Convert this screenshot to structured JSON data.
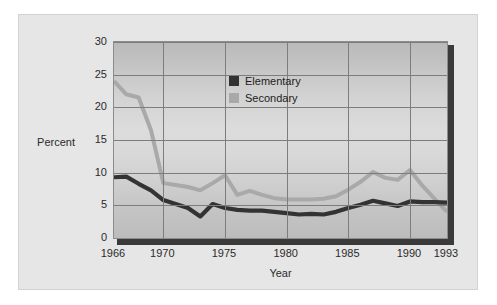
{
  "chart_data": {
    "type": "line",
    "title": "",
    "xlabel": "Year",
    "ylabel": "Percent",
    "xlim": [
      1966,
      1993
    ],
    "ylim": [
      0,
      30
    ],
    "ytick_labels": [
      "30",
      "25",
      "20",
      "15",
      "10",
      "5",
      "0"
    ],
    "ytick_values": [
      30,
      25,
      20,
      15,
      10,
      5,
      0
    ],
    "xtick_labels": [
      "1966",
      "1970",
      "1975",
      "1980",
      "1985",
      "1990",
      "1993"
    ],
    "xtick_values": [
      1966,
      1970,
      1975,
      1980,
      1985,
      1990,
      1993
    ],
    "grid": "both",
    "legend_position": "upper-right-inside",
    "x": [
      1966,
      1967,
      1968,
      1969,
      1970,
      1971,
      1972,
      1973,
      1974,
      1975,
      1976,
      1977,
      1978,
      1979,
      1980,
      1981,
      1982,
      1983,
      1984,
      1985,
      1986,
      1987,
      1988,
      1989,
      1990,
      1991,
      1992,
      1993
    ],
    "series": [
      {
        "name": "Elementary",
        "color": "#333333",
        "values": [
          9.3,
          9.4,
          8.3,
          7.3,
          5.8,
          5.2,
          4.6,
          3.3,
          5.2,
          4.6,
          4.3,
          4.2,
          4.2,
          4.0,
          3.8,
          3.6,
          3.7,
          3.6,
          4.0,
          4.6,
          5.1,
          5.7,
          5.3,
          4.9,
          5.6,
          5.5,
          5.5,
          5.4
        ]
      },
      {
        "name": "Secondary",
        "color": "#a9a9a9",
        "values": [
          24.0,
          22.0,
          21.5,
          16.5,
          8.4,
          8.1,
          7.8,
          7.3,
          8.4,
          9.6,
          6.6,
          7.2,
          6.6,
          6.1,
          5.9,
          5.9,
          5.9,
          6.0,
          6.4,
          7.4,
          8.6,
          10.1,
          9.2,
          8.9,
          10.4,
          8.0,
          6.0,
          4.0
        ]
      }
    ]
  },
  "legend": {
    "items": [
      {
        "label": "Elementary",
        "color": "#333333"
      },
      {
        "label": "Secondary",
        "color": "#a9a9a9"
      }
    ]
  }
}
